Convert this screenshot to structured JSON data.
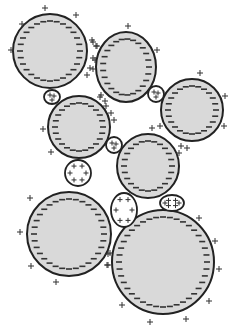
{
  "diagram": {
    "colors": {
      "large_fill": "#d9d9d9",
      "outline": "#222222",
      "small_fill": "#ffffff",
      "signs": "#333333"
    },
    "large_particles": [
      {
        "id": "L1",
        "cx": 50,
        "cy": 51,
        "rx": 37,
        "ry": 37,
        "charge": "-",
        "outer_plus": [
          [
            45,
            8
          ],
          [
            76,
            15
          ],
          [
            22,
            24
          ],
          [
            11,
            50
          ],
          [
            93,
            42
          ],
          [
            96,
            46
          ],
          [
            95,
            60
          ],
          [
            90,
            68
          ],
          [
            87,
            75
          ]
        ]
      },
      {
        "id": "L2",
        "cx": 126,
        "cy": 67,
        "rx": 30,
        "ry": 35,
        "charge": "-",
        "outer_plus": [
          [
            128,
            26
          ],
          [
            92,
            40
          ],
          [
            97,
            46
          ],
          [
            93,
            58
          ],
          [
            93,
            69
          ],
          [
            157,
            50
          ],
          [
            101,
            95
          ],
          [
            105,
            101
          ],
          [
            96,
            110
          ],
          [
            114,
            120
          ]
        ]
      },
      {
        "id": "L3",
        "cx": 192,
        "cy": 110,
        "rx": 31,
        "ry": 31,
        "charge": "-",
        "outer_plus": [
          [
            200,
            73
          ],
          [
            225,
            96
          ],
          [
            224,
            126
          ],
          [
            152,
            128
          ],
          [
            160,
            126
          ]
        ]
      },
      {
        "id": "L4",
        "cx": 79,
        "cy": 127,
        "rx": 31,
        "ry": 31,
        "charge": "-",
        "outer_plus": [
          [
            43,
            129
          ],
          [
            100,
            97
          ],
          [
            106,
            106
          ],
          [
            111,
            113
          ],
          [
            51,
            152
          ]
        ]
      },
      {
        "id": "L5",
        "cx": 148,
        "cy": 166,
        "rx": 31,
        "ry": 32,
        "charge": "-",
        "outer_plus": [
          [
            181,
            146
          ],
          [
            187,
            148
          ],
          [
            179,
            153
          ]
        ]
      },
      {
        "id": "L6",
        "cx": 69,
        "cy": 234,
        "rx": 42,
        "ry": 42,
        "charge": "-",
        "outer_plus": [
          [
            30,
            198
          ],
          [
            20,
            232
          ],
          [
            31,
            266
          ],
          [
            56,
            282
          ],
          [
            110,
            253
          ],
          [
            108,
            265
          ]
        ]
      },
      {
        "id": "L7",
        "cx": 163,
        "cy": 262,
        "rx": 51,
        "ry": 52,
        "charge": "-",
        "outer_plus": [
          [
            199,
            218
          ],
          [
            215,
            241
          ],
          [
            219,
            269
          ],
          [
            209,
            301
          ],
          [
            186,
            319
          ],
          [
            150,
            322
          ],
          [
            122,
            305
          ],
          [
            108,
            254
          ],
          [
            107,
            265
          ]
        ]
      }
    ],
    "small_particles": [
      {
        "id": "S1",
        "cx": 52,
        "cy": 97,
        "rx": 8,
        "ry": 7,
        "charge": "+"
      },
      {
        "id": "S2",
        "cx": 156,
        "cy": 94,
        "rx": 8,
        "ry": 8,
        "charge": "+"
      },
      {
        "id": "S3",
        "cx": 114,
        "cy": 145,
        "rx": 8,
        "ry": 8,
        "charge": "+"
      },
      {
        "id": "S4",
        "cx": 78,
        "cy": 173,
        "rx": 13,
        "ry": 13,
        "charge": "+"
      },
      {
        "id": "S5",
        "cx": 124,
        "cy": 210,
        "rx": 13,
        "ry": 17,
        "charge": "+"
      },
      {
        "id": "S6",
        "cx": 172,
        "cy": 203,
        "rx": 12,
        "ry": 8,
        "charge": "+"
      }
    ]
  }
}
